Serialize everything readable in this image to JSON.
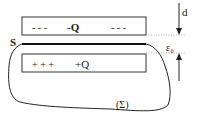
{
  "diagram": {
    "top_plate": {
      "charge_label": "-Q",
      "dashes_left": "- - -",
      "dashes_right": "- - -"
    },
    "bottom_plate": {
      "charge_label": "+Q",
      "pluses": "+ + +"
    },
    "surface_label": "S",
    "gaussian_surface_label": "(Σ)",
    "dimension_labels": {
      "distance": "d",
      "permittivity": "ε₀"
    },
    "colors": {
      "stroke": "#222222",
      "dotted": "#999999",
      "background": "#ffffff"
    }
  }
}
